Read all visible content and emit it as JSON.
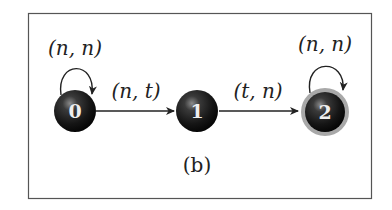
{
  "diagram": {
    "type": "finite-state-automaton",
    "caption": "(b)",
    "frame": {
      "border_color": "#555555"
    },
    "colors": {
      "node_fill": "#1a1a1a",
      "node_highlight": "#7a7a7a",
      "accepting_ring": "#a8a8a8",
      "edge": "#222222",
      "text": "#222222",
      "node_text": "#eeeeee"
    },
    "nodes": [
      {
        "id": "0",
        "label": "0",
        "accepting": false,
        "self_loop_label": "(n, n)"
      },
      {
        "id": "1",
        "label": "1",
        "accepting": false
      },
      {
        "id": "2",
        "label": "2",
        "accepting": true,
        "self_loop_label": "(n, n)"
      }
    ],
    "edges": [
      {
        "from": "0",
        "to": "0",
        "label": "(n, n)"
      },
      {
        "from": "0",
        "to": "1",
        "label": "(n, t)"
      },
      {
        "from": "1",
        "to": "2",
        "label": "(t, n)"
      },
      {
        "from": "2",
        "to": "2",
        "label": "(n, n)"
      }
    ]
  }
}
